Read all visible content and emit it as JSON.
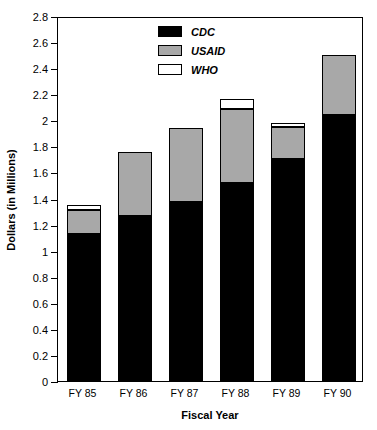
{
  "chart_data": {
    "type": "bar",
    "subtype": "stacked-vertical",
    "title": "",
    "xlabel": "Fiscal Year",
    "ylabel": "Dollars (in Millions)",
    "categories": [
      "FY 85",
      "FY 86",
      "FY 87",
      "FY 88",
      "FY 89",
      "FY 90"
    ],
    "series": [
      {
        "name": "CDC",
        "color": "#000000",
        "values": [
          1.13,
          1.265,
          1.375,
          1.52,
          1.7,
          2.04
        ]
      },
      {
        "name": "USAID",
        "color": "#a8a8a8",
        "values": [
          0.18,
          0.495,
          0.565,
          0.57,
          0.245,
          0.46
        ]
      },
      {
        "name": "WHO",
        "color": "#ffffff",
        "values": [
          0.04,
          0.0,
          0.0,
          0.07,
          0.035,
          0.0
        ]
      }
    ],
    "totals": [
      1.35,
      1.76,
      1.94,
      2.16,
      1.98,
      2.5
    ],
    "ylim": [
      0,
      2.8
    ],
    "ytick_step": 0.2,
    "yticks": [
      "0",
      "0.2",
      "0.4",
      "0.6",
      "0.8",
      "1",
      "1.2",
      "1.4",
      "1.6",
      "1.8",
      "2",
      "2.2",
      "2.4",
      "2.6",
      "2.8"
    ],
    "ytick_values": [
      0,
      0.2,
      0.4,
      0.6,
      0.8,
      1.0,
      1.2,
      1.4,
      1.6,
      1.8,
      2.0,
      2.2,
      2.4,
      2.6,
      2.8
    ],
    "grid": false,
    "legend_position": "top-center",
    "legend_entries": [
      "CDC",
      "USAID",
      "WHO"
    ],
    "stack_order_bottom_to_top": [
      "CDC",
      "USAID",
      "WHO"
    ]
  },
  "axis": {
    "y_title": "Dollars (in Millions)",
    "x_title": "Fiscal Year"
  },
  "legend": {
    "items": [
      {
        "label": "CDC",
        "swatch": "#000000"
      },
      {
        "label": "USAID",
        "swatch": "#a8a8a8"
      },
      {
        "label": "WHO",
        "swatch": "#ffffff"
      }
    ]
  },
  "colors": {
    "cdc": "#000000",
    "usaid": "#a8a8a8",
    "who": "#ffffff",
    "axis": "#000000",
    "background": "#ffffff"
  }
}
